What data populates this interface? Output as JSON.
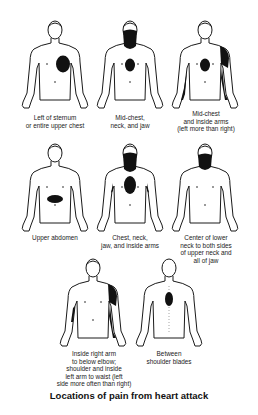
{
  "title": "Locations of pain from heart attack",
  "colors": {
    "outline": "#1a1a1a",
    "pain": "#111111",
    "background": "#ffffff"
  },
  "figures": [
    {
      "id": "left-of-sternum",
      "view": "front",
      "caption": "Left of sternum\nor entire upper chest",
      "pain_areas": [
        "left chest"
      ]
    },
    {
      "id": "mid-chest-neck-jaw",
      "view": "front",
      "caption": "Mid-chest,\nneck, and jaw",
      "pain_areas": [
        "mid-chest",
        "neck",
        "jaw"
      ]
    },
    {
      "id": "mid-chest-inside-arms",
      "view": "front",
      "caption": "Mid-chest\nand inside arms\n(left more than right)",
      "pain_areas": [
        "mid-chest",
        "left shoulder",
        "inside arms"
      ]
    },
    {
      "id": "upper-abdomen",
      "view": "front",
      "caption": "Upper abdomen",
      "pain_areas": [
        "upper abdomen"
      ]
    },
    {
      "id": "chest-neck-jaw-arms",
      "view": "front",
      "caption": "Chest, neck,\njaw, and inside arms",
      "pain_areas": [
        "chest",
        "neck",
        "jaw",
        "inside arms"
      ]
    },
    {
      "id": "lower-neck-jaw",
      "view": "front",
      "caption": "Center of lower\nneck to both sides\nof upper neck and\nall of jaw",
      "pain_areas": [
        "lower neck",
        "upper neck",
        "jaw"
      ]
    },
    {
      "id": "arms-shoulder-waist",
      "view": "front",
      "caption": "Inside right arm\nto below elbow;\nshoulder and inside\nleft arm to waist (left\nside more often than right)",
      "pain_areas": [
        "inside right arm",
        "left shoulder",
        "inside left arm"
      ]
    },
    {
      "id": "between-shoulder-blades",
      "view": "back",
      "caption": "Between\nshoulder blades",
      "pain_areas": [
        "between shoulder blades"
      ]
    }
  ]
}
